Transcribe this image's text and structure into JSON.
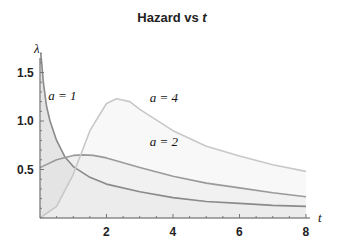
{
  "chart_data": {
    "type": "area",
    "title": "Hazard vs t",
    "title_main": "Hazard vs ",
    "title_var": "t",
    "xlabel": "t",
    "ylabel": "λ",
    "xlim": [
      0,
      8
    ],
    "ylim": [
      0,
      1.7
    ],
    "x_ticks": [
      "2",
      "4",
      "6",
      "8"
    ],
    "y_ticks": [
      "0.5",
      "1.0",
      "1.5"
    ],
    "grid": false,
    "series": [
      {
        "name": "a = 1",
        "label_x": 0.25,
        "label_y": 1.22,
        "color": "#8a8a8a",
        "fill": "#d0d0d0",
        "x": [
          0.02,
          0.05,
          0.1,
          0.2,
          0.3,
          0.5,
          0.75,
          1,
          1.5,
          2,
          3,
          4,
          5,
          6,
          7,
          8
        ],
        "y": [
          1.7,
          1.6,
          1.4,
          1.15,
          1.0,
          0.8,
          0.63,
          0.53,
          0.42,
          0.35,
          0.27,
          0.21,
          0.17,
          0.15,
          0.13,
          0.12
        ]
      },
      {
        "name": "a = 2",
        "label_x": 3.3,
        "label_y": 0.74,
        "color": "#9a9a9a",
        "fill": "#e4e4e4",
        "x": [
          0,
          0.5,
          1,
          1.3,
          1.6,
          2,
          3,
          4,
          5,
          6,
          7,
          8
        ],
        "y": [
          0.52,
          0.6,
          0.645,
          0.65,
          0.645,
          0.62,
          0.52,
          0.43,
          0.36,
          0.31,
          0.26,
          0.22
        ]
      },
      {
        "name": "a = 4",
        "label_x": 3.3,
        "label_y": 1.2,
        "color": "#c8c8c8",
        "fill": "#f3f3f3",
        "x": [
          0,
          0.5,
          1,
          1.5,
          2,
          2.3,
          2.7,
          3,
          4,
          5,
          6,
          7,
          8
        ],
        "y": [
          0,
          0.12,
          0.45,
          0.9,
          1.18,
          1.23,
          1.2,
          1.12,
          0.9,
          0.74,
          0.64,
          0.55,
          0.48
        ]
      }
    ]
  }
}
